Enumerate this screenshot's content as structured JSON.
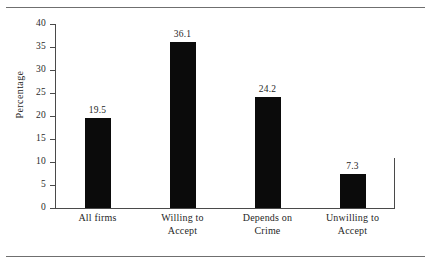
{
  "figure": {
    "background_color": "#ffffff",
    "rule_color": "#6f6f6f",
    "axis_color": "#4a4a4a",
    "bar_color": "#0b0b0b",
    "text_color": "#1f1f1f"
  },
  "chart_data": {
    "type": "bar",
    "title": "",
    "subtitle": "",
    "xlabel": "",
    "ylabel": "Percentage",
    "categories": [
      "All firms",
      "Willing to Accept",
      "Depends on Crime",
      "Unwilling to Accept"
    ],
    "category_lines": [
      [
        "All firms",
        ""
      ],
      [
        "Willing to",
        "Accept"
      ],
      [
        "Depends on",
        "Crime"
      ],
      [
        "Unwilling to",
        "Accept"
      ]
    ],
    "values": [
      19.5,
      36.1,
      24.2,
      7.3
    ],
    "value_labels": [
      "19.5",
      "36.1",
      "24.2",
      "7.3"
    ],
    "ylim": [
      0,
      40
    ],
    "ytick_values": [
      0,
      5,
      10,
      15,
      20,
      25,
      30,
      35,
      40
    ],
    "ytick_labels": [
      "0",
      "5",
      "10",
      "15",
      "20",
      "25",
      "30",
      "35",
      "40"
    ],
    "grid": false,
    "legend": null,
    "legend_position": "none",
    "annotations": []
  }
}
